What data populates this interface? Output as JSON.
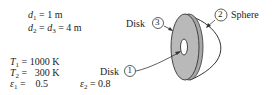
{
  "given": {
    "d1": {
      "symbol": "d",
      "sub": "1",
      "rest": " = 1 m"
    },
    "d2d3": {
      "symbol1": "d",
      "sub1": "2",
      "mid": " = ",
      "symbol2": "d",
      "sub2": "3",
      "rest": " = 4 m"
    },
    "T1": {
      "symbol": "T",
      "sub": "1",
      "rest": " = 1000 K"
    },
    "T2": {
      "symbol": "T",
      "sub": "2",
      "rest": " =   300 K"
    },
    "e1": {
      "symbol": "ε",
      "sub": "1",
      "rest": " =    0.5"
    },
    "e2": {
      "symbol": "ε",
      "sub": "2",
      "rest": " = 0.8"
    }
  },
  "labels": {
    "disk3": {
      "text": "Disk",
      "num": "3"
    },
    "disk1": {
      "text": "Disk",
      "num": "1"
    },
    "sphere2": {
      "text": "Sphere",
      "num": "2"
    }
  },
  "colors": {
    "disk_fill": "#b9b9b9",
    "stroke": "#333333"
  }
}
